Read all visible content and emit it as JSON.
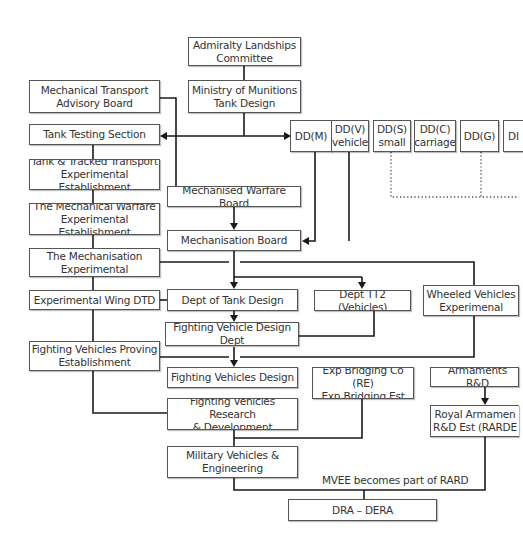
{
  "diagram": {
    "nodes": {
      "admiralty": "Admiralty Landships\nCommittee",
      "ministry": "Ministry of Munitions\nTank Design",
      "mtab": "Mechanical Transport\nAdvisory Board",
      "tts": "Tank Testing Section",
      "ttee": "Tank & Tracked Transport\nExperimental Establishment",
      "mwee": "The Mechanical Warfare\nExperimental Establishment",
      "mwb": "Mechanised Warfare Board",
      "mb": "Mechanisation Board",
      "me": "The Mechanisation\nExperimental",
      "ewdtd": "Experimental Wing DTD",
      "dtd": "Dept of Tank Design",
      "tt2": "Dept TT2 (Vehicles)",
      "wve": "Wheeled Vehicles\nExperimenal",
      "fvdd": "Fighting Vehicle Design Dept",
      "fvpe": "Fighting Vehicles Proving\nEstablishment",
      "fvd": "Fighting Vehicles Design",
      "ebc": "Exp Bridging Co (RE)\nExp Bridging Est",
      "ard": "Armaments R&D",
      "rarde": "Royal Armamen\nR&D Est (RARDE",
      "fvrd": "Fighting Vehicles Research\n& Development",
      "mve": "Military Vehicles &\nEngineering",
      "dra": "DRA – DERA",
      "ddm": "DD(M)",
      "ddv": "DD(V)\nvehicle",
      "dds": "DD(S)\nsmall",
      "ddc": "DD(C)\ncarriage",
      "ddg": "DD(G)",
      "ddx": "DI"
    },
    "annotations": {
      "mvee_rard": "MVEE becomes part of RARD"
    },
    "colors": {
      "line": "#1a1a1a",
      "border": "#555555",
      "text": "#333333",
      "background": "#ffffff"
    }
  }
}
